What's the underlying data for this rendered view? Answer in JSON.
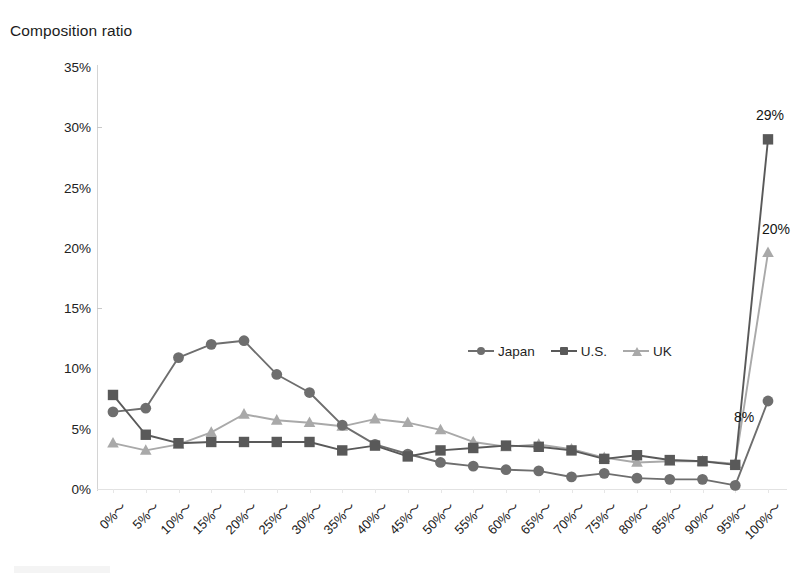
{
  "chart_data": {
    "type": "line",
    "title": "Composition ratio",
    "xlabel": "",
    "ylabel": "Composition ratio",
    "ylim": [
      0,
      35
    ],
    "ytick_labels": [
      "0%",
      "5%",
      "10%",
      "15%",
      "20%",
      "25%",
      "30%",
      "35%"
    ],
    "ytick_values": [
      0,
      5,
      10,
      15,
      20,
      25,
      30,
      35
    ],
    "grid": false,
    "legend_position": "center",
    "categories": [
      "0%〜",
      "5%〜",
      "10%〜",
      "15%〜",
      "20%〜",
      "25%〜",
      "30%〜",
      "35%〜",
      "40%〜",
      "45%〜",
      "50%〜",
      "55%〜",
      "60%〜",
      "65%〜",
      "70%〜",
      "75%〜",
      "80%〜",
      "85%〜",
      "90%〜",
      "95%〜",
      "100%〜"
    ],
    "series": [
      {
        "name": "Japan",
        "marker": "circle",
        "color": "#6E6E6E",
        "values": [
          6.4,
          6.7,
          10.9,
          12.0,
          12.3,
          9.5,
          8.0,
          5.3,
          3.7,
          2.9,
          2.2,
          1.9,
          1.6,
          1.5,
          1.0,
          1.3,
          0.9,
          0.8,
          0.8,
          0.3,
          7.3
        ]
      },
      {
        "name": "U.S.",
        "marker": "square",
        "color": "#595959",
        "values": [
          7.8,
          4.5,
          3.8,
          3.9,
          3.9,
          3.9,
          3.9,
          3.2,
          3.6,
          2.7,
          3.2,
          3.4,
          3.6,
          3.5,
          3.2,
          2.5,
          2.8,
          2.4,
          2.3,
          2.0,
          29.0
        ]
      },
      {
        "name": "UK",
        "marker": "triangle",
        "color": "#A9A9A9",
        "values": [
          3.8,
          3.2,
          3.7,
          4.7,
          6.2,
          5.7,
          5.5,
          5.2,
          5.8,
          5.5,
          4.9,
          3.9,
          3.5,
          3.7,
          3.3,
          2.6,
          2.2,
          2.3,
          2.3,
          2.1,
          19.6
        ]
      }
    ],
    "data_labels": [
      {
        "series": "U.S.",
        "category": "100%〜",
        "text": "29%"
      },
      {
        "series": "UK",
        "category": "100%〜",
        "text": "20%"
      },
      {
        "series": "Japan",
        "category": "100%〜",
        "text": "8%"
      }
    ]
  }
}
